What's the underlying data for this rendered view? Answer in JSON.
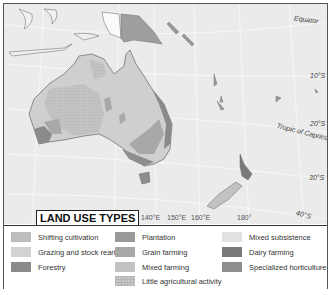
{
  "map": {
    "labels": {
      "equator": "Equator",
      "lat_10s": "10°S",
      "lat_20s": "20°S",
      "tropic": "Tropic of Capricorn",
      "lat_30s": "30°S",
      "lat_40s": "40°S"
    },
    "longitudes": [
      "140°E",
      "150°E",
      "160°E",
      "180°"
    ]
  },
  "legend": {
    "title": "LAND USE TYPES",
    "items": [
      {
        "label": "Shifting cultivation",
        "color": "#bdbdbd"
      },
      {
        "label": "Grazing and stock rearing",
        "color": "#d2d2d2"
      },
      {
        "label": "Forestry",
        "color": "#8a8a8a"
      },
      {
        "label": "Plantation",
        "color": "#9a9a9a"
      },
      {
        "label": "Grain farming",
        "color": "#a8a8a8"
      },
      {
        "label": "Mixed farming",
        "color": "#c2c2c2"
      },
      {
        "label": "Little agricultural activity",
        "color": "#c8c8c8"
      },
      {
        "label": "Mixed subsistence",
        "color": "#e2e2e2"
      },
      {
        "label": "Dairy farming",
        "color": "#7a7a7a"
      },
      {
        "label": "Specialized horticulture",
        "color": "#8e8e8e"
      }
    ]
  }
}
